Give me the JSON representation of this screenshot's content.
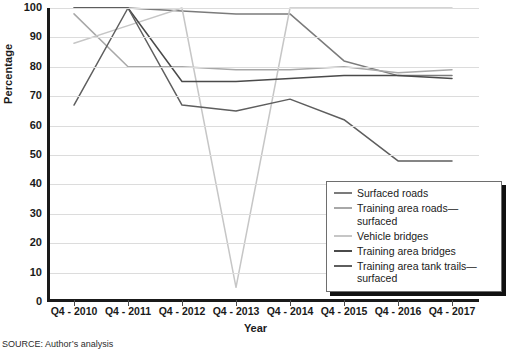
{
  "chart_data": {
    "type": "line",
    "title": "",
    "xlabel": "Year",
    "ylabel": "Percentage",
    "ylim": [
      0,
      100
    ],
    "ytick_step": 10,
    "grid": true,
    "legend_position": "inside-bottom-right",
    "categories": [
      "Q4 - 2010",
      "Q4 - 2011",
      "Q4 - 2012",
      "Q4 - 2013",
      "Q4 - 2014",
      "Q4 - 2015",
      "Q4 - 2016",
      "Q4 - 2017"
    ],
    "yticks": [
      "0",
      "10",
      "20",
      "30",
      "40",
      "50",
      "60",
      "70",
      "80",
      "90",
      "100"
    ],
    "series": [
      {
        "name": "Surfaced roads",
        "color": "#7b7b7b",
        "values": [
          100,
          100,
          99,
          98,
          98,
          82,
          77,
          77
        ]
      },
      {
        "name": "Training area roads—surfaced",
        "color": "#a8a8a8",
        "values": [
          98,
          80,
          80,
          79,
          79,
          80,
          78,
          79
        ]
      },
      {
        "name": "Vehicle bridges",
        "color": "#c6c6c6",
        "values": [
          88,
          94,
          100,
          5,
          100,
          100,
          100,
          100
        ]
      },
      {
        "name": "Training area bridges",
        "color": "#4a4a4a",
        "values": [
          100,
          100,
          75,
          75,
          76,
          77,
          77,
          76
        ]
      },
      {
        "name": "Training area tank trails—surfaced",
        "color": "#5e5e5e",
        "values": [
          67,
          100,
          67,
          65,
          69,
          62,
          48,
          48
        ]
      }
    ]
  },
  "legend": {
    "items": [
      "Surfaced roads",
      "Training area roads—surfaced",
      "Vehicle bridges",
      "Training area bridges",
      "Training area tank trails—surfaced"
    ]
  },
  "source": {
    "text": "SOURCE: Author’s analysis"
  }
}
